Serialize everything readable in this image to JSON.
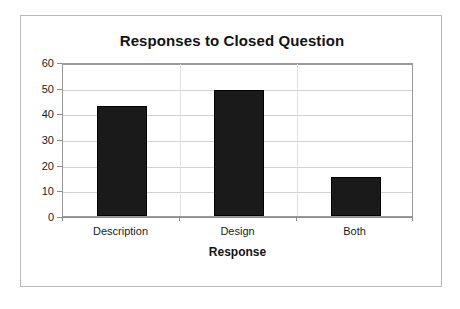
{
  "chart_data": {
    "type": "bar",
    "title": "Responses to Closed Question",
    "xlabel": "Response",
    "ylabel": "Number of Participants",
    "categories": [
      "Description",
      "Design",
      "Both"
    ],
    "values": [
      43,
      49,
      15
    ],
    "series": [
      {
        "name": "Number of Participants",
        "values": [
          43,
          49,
          15
        ]
      }
    ],
    "ylim": [
      0,
      60
    ],
    "ytick_labels": [
      "0",
      "10",
      "20",
      "30",
      "40",
      "50",
      "60"
    ],
    "ytick_values": [
      0,
      10,
      20,
      30,
      40,
      50,
      60
    ],
    "ytick_step": 10,
    "grid": true,
    "grid_axis": "y",
    "legend": false,
    "legend_position": "none",
    "bar_color": "#1a1a1a",
    "gridline_color": "#d2d2d2",
    "axis_color": "#8d8d8d",
    "plot_background": "#ffffff",
    "frame_border_color": "#b8b8b8"
  }
}
